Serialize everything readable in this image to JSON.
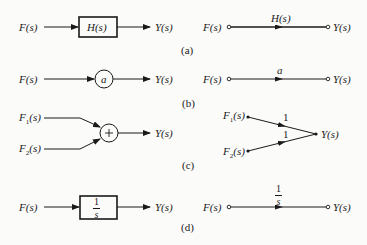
{
  "figure": {
    "parts": [
      {
        "id": "a",
        "caption": "(a)",
        "block_diagram": {
          "input": "F(s)",
          "block": "H(s)",
          "output": "Y(s)"
        },
        "signal_flow": {
          "input": "F(s)",
          "gain": "H(s)",
          "output": "Y(s)"
        }
      },
      {
        "id": "b",
        "caption": "(b)",
        "block_diagram": {
          "input": "F(s)",
          "multiplier": "a",
          "output": "Y(s)"
        },
        "signal_flow": {
          "input": "F(s)",
          "gain": "a",
          "output": "Y(s)"
        }
      },
      {
        "id": "c",
        "caption": "(c)",
        "block_diagram": {
          "input1": "F1(s)",
          "input2": "F2(s)",
          "summer": "+",
          "output": "Y(s)"
        },
        "signal_flow": {
          "input1": "F1(s)",
          "input2": "F2(s)",
          "gain1": "1",
          "gain2": "1",
          "output": "Y(s)"
        }
      },
      {
        "id": "d",
        "caption": "(d)",
        "block_diagram": {
          "input": "F(s)",
          "block_num": "1",
          "block_den": "s",
          "output": "Y(s)"
        },
        "signal_flow": {
          "input": "F(s)",
          "gain_num": "1",
          "gain_den": "s",
          "output": "Y(s)"
        }
      }
    ]
  }
}
